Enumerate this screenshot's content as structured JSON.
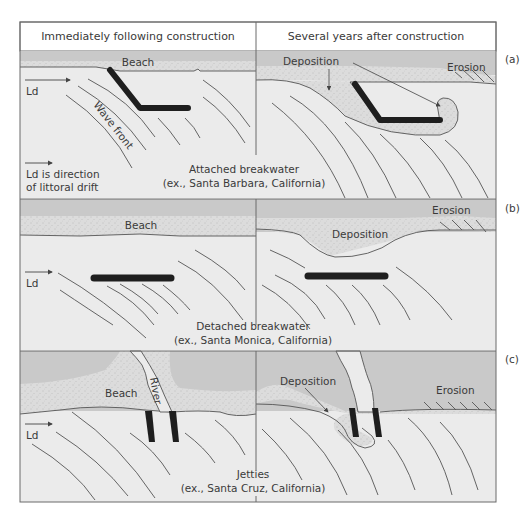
{
  "figure": {
    "column_headers": [
      "Immediately following construction",
      "Several years after construction"
    ],
    "colors": {
      "ocean": "#ebebeb",
      "land": "#c9c9c9",
      "sand": "#dcdcdc",
      "structure": "#1e1e1e",
      "line": "#555555",
      "header_bg": "#ffffff"
    },
    "panels": [
      {
        "tag": "(a)",
        "caption_line1": "Attached breakwater",
        "caption_line2": "(ex., Santa Barbara, California)",
        "left": {
          "beach_label": "Beach",
          "wave_label": "Wave front",
          "drift_label": "Ld",
          "legend_line1": "Ld is direction",
          "legend_line2": "of littoral drift"
        },
        "right": {
          "deposition_label": "Deposition",
          "erosion_label": "Erosion"
        }
      },
      {
        "tag": "(b)",
        "caption_line1": "Detached breakwater",
        "caption_line2": "(ex., Santa Monica, California)",
        "left": {
          "beach_label": "Beach",
          "drift_label": "Ld"
        },
        "right": {
          "deposition_label": "Deposition",
          "erosion_label": "Erosion"
        }
      },
      {
        "tag": "(c)",
        "caption_line1": "Jetties",
        "caption_line2": "(ex., Santa Cruz, California)",
        "left": {
          "beach_label": "Beach",
          "river_label": "River",
          "drift_label": "Ld"
        },
        "right": {
          "deposition_label": "Deposition",
          "erosion_label": "Erosion"
        }
      }
    ]
  }
}
